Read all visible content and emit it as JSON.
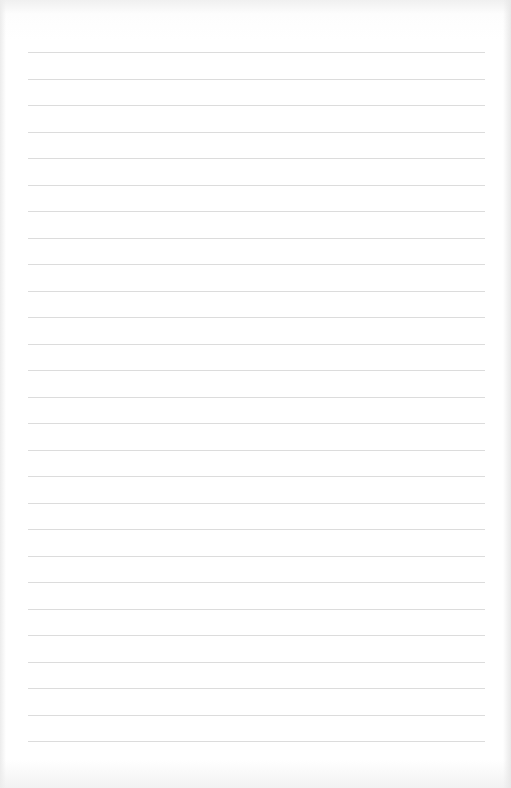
{
  "page": {
    "type": "lined-paper",
    "line_count": 27,
    "first_line_y": 52,
    "line_spacing": 26.5,
    "line_left": 28,
    "line_width": 457,
    "line_color": "#dcdcdc",
    "background_color": "#ffffff"
  }
}
